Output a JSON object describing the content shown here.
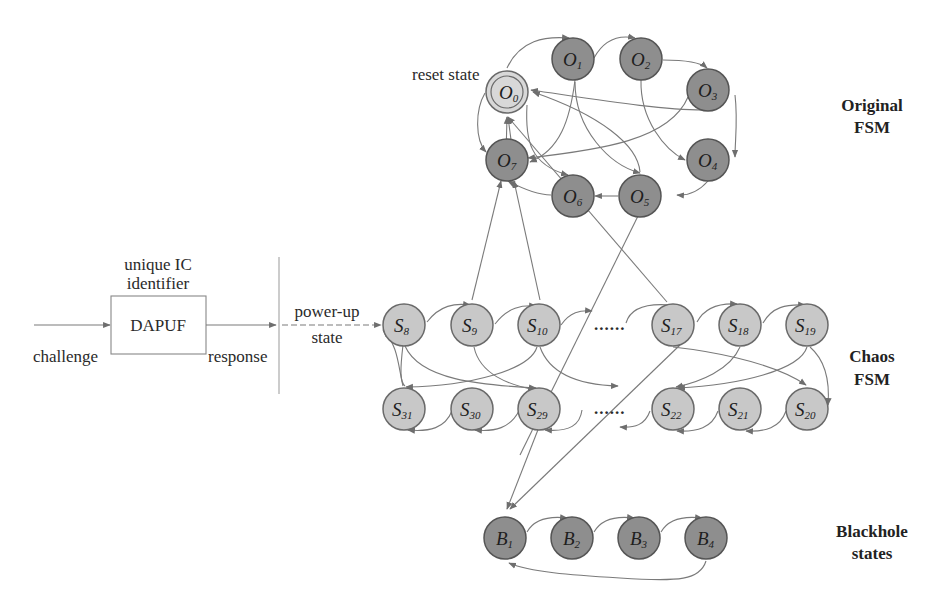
{
  "colors": {
    "edge": "#7a7a7a",
    "chaos_node_fill": "#c8c8c8",
    "original_node_fill": "#8e8e8e",
    "blackhole_node_fill": "#8e8e8e",
    "reset_node_fill": "#d8d8d8"
  },
  "left_block": {
    "box_label": "DAPUF",
    "box_caption_line1": "unique IC",
    "box_caption_line2": "identifier",
    "input_label": "challenge",
    "output_label": "response",
    "powerup_line1": "power-up",
    "powerup_line2": "state"
  },
  "original_fsm": {
    "title_line1": "Original",
    "title_line2": "FSM",
    "reset_label": "reset state",
    "nodes": [
      {
        "base": "O",
        "sub": "0"
      },
      {
        "base": "O",
        "sub": "1"
      },
      {
        "base": "O",
        "sub": "2"
      },
      {
        "base": "O",
        "sub": "3"
      },
      {
        "base": "O",
        "sub": "4"
      },
      {
        "base": "O",
        "sub": "5"
      },
      {
        "base": "O",
        "sub": "6"
      },
      {
        "base": "O",
        "sub": "7"
      }
    ]
  },
  "chaos_fsm": {
    "title_line1": "Chaos",
    "title_line2": "FSM",
    "ellipsis": "......",
    "top_row": [
      {
        "base": "S",
        "sub": "8"
      },
      {
        "base": "S",
        "sub": "9"
      },
      {
        "base": "S",
        "sub": "10"
      },
      {
        "base": "S",
        "sub": "17"
      },
      {
        "base": "S",
        "sub": "18"
      },
      {
        "base": "S",
        "sub": "19"
      }
    ],
    "bottom_row": [
      {
        "base": "S",
        "sub": "31"
      },
      {
        "base": "S",
        "sub": "30"
      },
      {
        "base": "S",
        "sub": "29"
      },
      {
        "base": "S",
        "sub": "22"
      },
      {
        "base": "S",
        "sub": "21"
      },
      {
        "base": "S",
        "sub": "20"
      }
    ]
  },
  "blackhole": {
    "title_line1": "Blackhole",
    "title_line2": "states",
    "nodes": [
      {
        "base": "B",
        "sub": "1"
      },
      {
        "base": "B",
        "sub": "2"
      },
      {
        "base": "B",
        "sub": "3"
      },
      {
        "base": "B",
        "sub": "4"
      }
    ]
  }
}
